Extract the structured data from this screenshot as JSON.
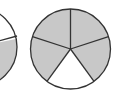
{
  "diagram": {
    "colors": {
      "shaded": "#c8c8c8",
      "unshaded": "#ffffff",
      "stroke": "#333333"
    },
    "circles": [
      {
        "name": "partial-circle",
        "cx": -23,
        "cy": 47,
        "r": 40,
        "cut_off": true
      },
      {
        "name": "five-part-circle",
        "cx": 70.5,
        "cy": 49,
        "r": 40,
        "parts": 5,
        "shaded": 4
      }
    ]
  }
}
